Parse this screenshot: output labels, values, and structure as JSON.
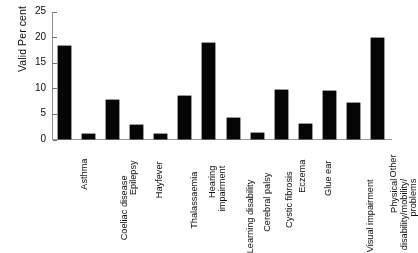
{
  "chart_data": {
    "type": "bar",
    "title": "",
    "xlabel": "",
    "ylabel": "Valid Per cent",
    "ylim": [
      0,
      25
    ],
    "yticks": [
      0,
      5,
      10,
      15,
      20,
      25
    ],
    "grid": false,
    "legend": null,
    "categories": [
      "Asthma",
      "Coeliac disease",
      "Epilepsy",
      "Hayfever",
      "Thalassaemia",
      "Hearing impairment",
      "Learning disability",
      "Cerebral palsy",
      "Cystic fibrosis",
      "Eczema",
      "Glue ear",
      "Visual impairment",
      "Physical disability/mobility/problems",
      "Other"
    ],
    "values": [
      18.2,
      1.0,
      7.6,
      2.7,
      1.0,
      8.4,
      18.8,
      4.1,
      1.1,
      9.5,
      2.9,
      9.4,
      7.1,
      19.8
    ],
    "bar_color": "#0b0b0b"
  },
  "axis": {
    "y_title": "Valid Per cent",
    "ticks": [
      "0",
      "5",
      "10",
      "15",
      "20",
      "25"
    ]
  },
  "categories": [
    {
      "lines": [
        "Asthma"
      ]
    },
    {
      "lines": [
        "Coeliac disease"
      ]
    },
    {
      "lines": [
        "Epilepsy"
      ]
    },
    {
      "lines": [
        "Hayfever"
      ]
    },
    {
      "lines": [
        "Thalassaemia"
      ]
    },
    {
      "lines": [
        "Hearing",
        "impairment"
      ]
    },
    {
      "lines": [
        "Learning disability"
      ]
    },
    {
      "lines": [
        "Cerebral palsy"
      ]
    },
    {
      "lines": [
        "Cystic fibrosis"
      ]
    },
    {
      "lines": [
        "Eczema"
      ]
    },
    {
      "lines": [
        "Glue ear"
      ]
    },
    {
      "lines": [
        "Visual impairment"
      ]
    },
    {
      "lines": [
        "Physical",
        "disability/mobility/",
        "problems"
      ]
    },
    {
      "lines": [
        "Other"
      ]
    }
  ],
  "caption": {
    "text": ""
  }
}
